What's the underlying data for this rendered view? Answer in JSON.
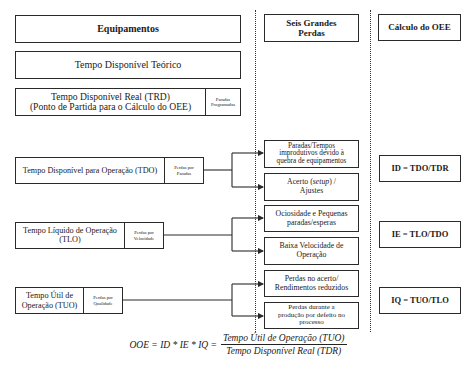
{
  "columns": {
    "equipment": {
      "header": "Equipamentos"
    },
    "losses": {
      "header_line1": "Seis Grandes",
      "header_line2": "Perdas"
    },
    "calc": {
      "header": "Cálculo do OEE"
    }
  },
  "times": {
    "theoretical": "Tempo Disponível Teórico",
    "trd": {
      "line1": "Tempo Disponível Real (TRD)",
      "line2": "(Ponto de Partida para o Cálculo do OEE)",
      "loss_line1": "Paradas",
      "loss_line2": "Programadas"
    },
    "tdo": {
      "label": "Tempo Disponível para Operação (TDO)",
      "loss_line1": "Perdas por",
      "loss_line2": "Paradas"
    },
    "tlo": {
      "line1": "Tempo Líquido de Operação",
      "line2": "(TLO)",
      "loss_line1": "Perdas por",
      "loss_line2": "Velocidade"
    },
    "tuo": {
      "line1": "Tempo Útil de",
      "line2": "Operação (TUO)",
      "loss_line1": "Perdas por",
      "loss_line2": "Qualidade"
    }
  },
  "six_losses": [
    {
      "line1": "Paradas/Tempos",
      "line2": "improdutivos devido à",
      "line3": "quebra de equipamentos"
    },
    {
      "line1_pre": "Acerto (",
      "line1_em": "setup",
      "line1_post": ") /",
      "line2": "Ajustes"
    },
    {
      "line1": "Ociosidade e Pequenas",
      "line2": "paradas/esperas"
    },
    {
      "line1": "Baixa Velocidade de",
      "line2": "Operação"
    },
    {
      "line1": "Perdas no acerto/",
      "line2": "Rendimentos reduzidos"
    },
    {
      "line1": "Perdas durante a",
      "line2": "produção por defeito no",
      "line3": "processo"
    }
  ],
  "indices": [
    {
      "formula": "ID = TDO/TDR"
    },
    {
      "formula": "IE = TLO/TDO"
    },
    {
      "formula": "IQ = TUO/TLO"
    }
  ],
  "oee_formula": {
    "lhs": "OOE = ID * IE * IQ =",
    "numerator": "Tempo Útil de Operação (TUO)",
    "denominator": "Tempo Disponível Real (TDR)"
  },
  "colors": {
    "line": "#2a2a2a",
    "background": "#ffffff"
  }
}
